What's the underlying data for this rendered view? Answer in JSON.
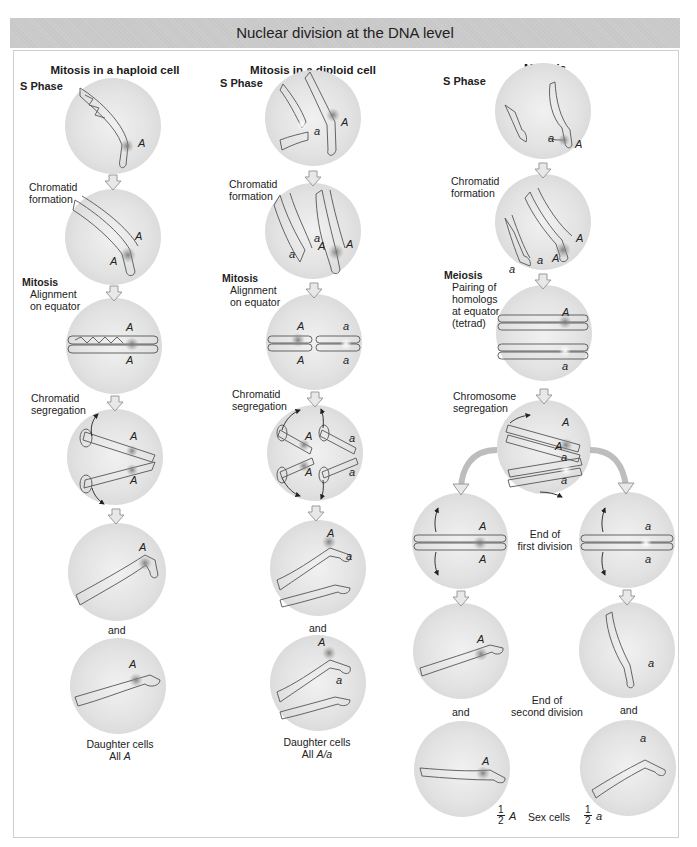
{
  "title": "Nuclear division at the DNA level",
  "columns": {
    "haploid": {
      "heading": "Mitosis in a haploid cell",
      "labels": {
        "s_phase": "S Phase",
        "chromatid_formation_1": "Chromatid",
        "chromatid_formation_2": "formation",
        "mitosis": "Mitosis",
        "alignment_1": "Alignment",
        "alignment_2": "on equator",
        "segregation_1": "Chromatid",
        "segregation_2": "segregation",
        "and": "and",
        "result_1": "Daughter cells",
        "result_2_prefix": "All ",
        "result_2_allele": "A"
      }
    },
    "diploid": {
      "heading": "Mitosis in a diploid cell",
      "labels": {
        "s_phase": "S Phase",
        "chromatid_formation_1": "Chromatid",
        "chromatid_formation_2": "formation",
        "mitosis": "Mitosis",
        "alignment_1": "Alignment",
        "alignment_2": "on equator",
        "segregation_1": "Chromatid",
        "segregation_2": "segregation",
        "and": "and",
        "result_1": "Daughter cells",
        "result_2_prefix": "All ",
        "result_2_allele": "A/a"
      }
    },
    "meiosis": {
      "heading": "Meiosis",
      "labels": {
        "s_phase": "S Phase",
        "chromatid_formation_1": "Chromatid",
        "chromatid_formation_2": "formation",
        "meiosis": "Meiosis",
        "pairing_1": "Pairing of",
        "pairing_2": "homologs",
        "pairing_3": "at equator",
        "pairing_4": "(tetrad)",
        "segregation_1": "Chromosome",
        "segregation_2": "segregation",
        "end_first_1": "End of",
        "end_first_2": "first division",
        "end_second_1": "End of",
        "end_second_2": "second division",
        "and_left": "and",
        "and_right": "and",
        "sex_cells": "Sex cells",
        "frac_num": "1",
        "frac_den": "2",
        "allele_left": "A",
        "allele_right": "a"
      }
    }
  },
  "alleles": {
    "dominant": "A",
    "recessive": "a"
  },
  "colors": {
    "title_bar": "#c8c8c8",
    "cell_fill": "#e2e2e2",
    "arrow_fill": "#e6e6e6",
    "arrow_stroke": "#9a9a9a",
    "chromosome_stroke": "#555555",
    "centromere_dominant": "#8a8a8a",
    "centromere_recessive": "#ffffff"
  }
}
